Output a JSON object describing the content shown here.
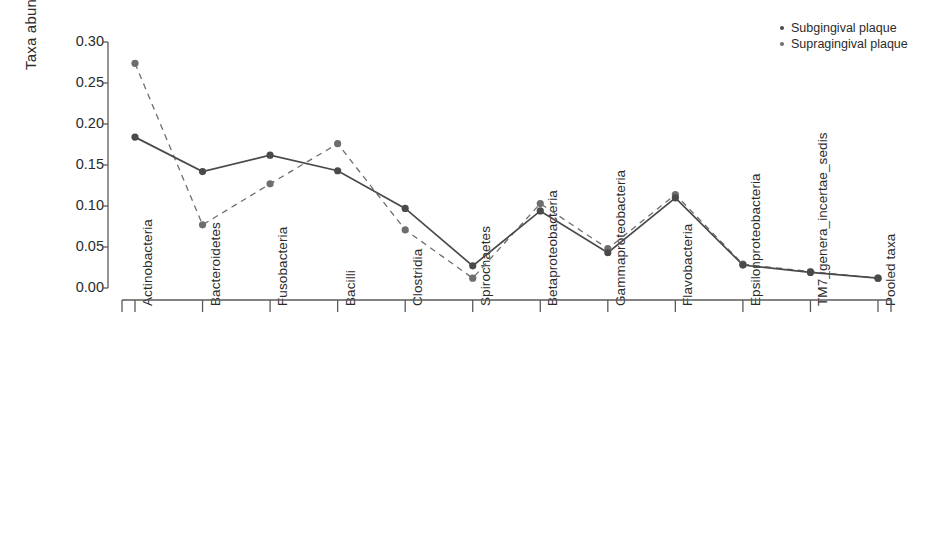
{
  "chart_data": {
    "type": "line",
    "title": "",
    "xlabel": "",
    "ylabel": "Taxa abundance",
    "ylim": [
      0.0,
      0.3
    ],
    "yticks": [
      "0.00",
      "0.05",
      "0.10",
      "0.15",
      "0.20",
      "0.25",
      "0.30"
    ],
    "ytick_values": [
      0.0,
      0.05,
      0.1,
      0.15,
      0.2,
      0.25,
      0.3
    ],
    "grid": false,
    "legend_position": "top-right",
    "categories": [
      "Actinobacteria",
      "Bacteroidetes",
      "Fusobacteria",
      "Bacilli",
      "Clostridia",
      "Spirochaetes",
      "Betaproteobacteria",
      "Gammaproteobacteria",
      "Flavobacteria",
      "Epsilonproteobacteria",
      "TM7_genera_incertae_sedis",
      "Pooled taxa"
    ],
    "series": [
      {
        "name": "Subgingival plaque",
        "style": "solid",
        "color": "#4a4a4a",
        "marker": "circle",
        "values": [
          0.184,
          0.142,
          0.162,
          0.143,
          0.097,
          0.027,
          0.094,
          0.043,
          0.11,
          0.028,
          0.019,
          0.012
        ]
      },
      {
        "name": "Supragingival plaque",
        "style": "dashed",
        "color": "#6e6e6e",
        "marker": "circle",
        "values": [
          0.274,
          0.077,
          0.127,
          0.176,
          0.071,
          0.012,
          0.103,
          0.048,
          0.114,
          0.029,
          0.02,
          0.012
        ]
      }
    ]
  },
  "legend": {
    "items": [
      {
        "label": "Subgingival plaque",
        "marker": "dot"
      },
      {
        "label": "Supragingival plaque",
        "marker": "dot"
      }
    ]
  },
  "axes": {
    "y_title": "Taxa abundance"
  }
}
